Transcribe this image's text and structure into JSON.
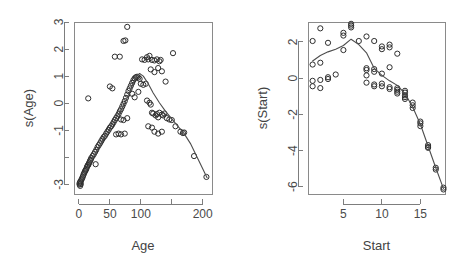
{
  "figure": {
    "background": "#ffffff",
    "foreground": "#3a3a3a",
    "point_color": "#2e2e2e",
    "curve_color": "#4d4d4d",
    "axis_color": "#7d7d7d"
  },
  "chart_data": [
    {
      "type": "scatter",
      "title": "",
      "xlabel": "Age",
      "ylabel": "s(Age)",
      "xlim": [
        -8,
        215
      ],
      "ylim": [
        -3.35,
        3.0
      ],
      "xticks": [
        0,
        50,
        100,
        150,
        200
      ],
      "xticklabels": [
        "0",
        "50",
        "100",
        "",
        "200"
      ],
      "yticks": [
        -3,
        -2,
        -1,
        0,
        1,
        2,
        3
      ],
      "yticklabels": [
        "-3",
        "",
        "-1",
        "0",
        "1",
        "2",
        "3"
      ],
      "grid": false,
      "legend": null,
      "series": [
        {
          "name": "partial residuals",
          "type": "scatter",
          "marker": "open-circle",
          "points": [
            [
              1,
              -2.95
            ],
            [
              1,
              -3.0
            ],
            [
              2,
              -2.9
            ],
            [
              2,
              -3.05
            ],
            [
              3,
              -2.88
            ],
            [
              3,
              -2.98
            ],
            [
              4,
              -2.82
            ],
            [
              5,
              -2.78
            ],
            [
              6,
              -2.72
            ],
            [
              7,
              -2.66
            ],
            [
              8,
              -2.6
            ],
            [
              9,
              -2.55
            ],
            [
              10,
              -2.5
            ],
            [
              11,
              -2.46
            ],
            [
              12,
              -2.42
            ],
            [
              13,
              -2.35
            ],
            [
              14,
              -2.3
            ],
            [
              15,
              -2.28
            ],
            [
              16,
              -2.22
            ],
            [
              17,
              -2.18
            ],
            [
              18,
              -2.12
            ],
            [
              19,
              -2.08
            ],
            [
              20,
              -2.02
            ],
            [
              22,
              -1.95
            ],
            [
              24,
              -1.88
            ],
            [
              26,
              -1.8
            ],
            [
              27,
              -2.25
            ],
            [
              28,
              -1.72
            ],
            [
              30,
              -1.62
            ],
            [
              32,
              -1.55
            ],
            [
              34,
              -1.48
            ],
            [
              36,
              -1.4
            ],
            [
              38,
              -1.32
            ],
            [
              40,
              -1.25
            ],
            [
              42,
              -1.2
            ],
            [
              44,
              -1.12
            ],
            [
              46,
              -1.05
            ],
            [
              48,
              -0.98
            ],
            [
              50,
              -0.9
            ],
            [
              52,
              -0.85
            ],
            [
              54,
              -0.78
            ],
            [
              56,
              -0.7
            ],
            [
              58,
              -0.62
            ],
            [
              60,
              -0.55
            ],
            [
              62,
              -0.48
            ],
            [
              64,
              -0.4
            ],
            [
              66,
              -0.3
            ],
            [
              68,
              -0.22
            ],
            [
              70,
              -0.12
            ],
            [
              72,
              -0.02
            ],
            [
              74,
              0.08
            ],
            [
              76,
              0.2
            ],
            [
              78,
              0.32
            ],
            [
              80,
              0.45
            ],
            [
              82,
              0.55
            ],
            [
              84,
              0.65
            ],
            [
              86,
              0.75
            ],
            [
              88,
              0.85
            ],
            [
              90,
              0.92
            ],
            [
              92,
              0.96
            ],
            [
              94,
              0.98
            ],
            [
              96,
              0.95
            ],
            [
              98,
              0.9
            ],
            [
              15,
              0.18
            ],
            [
              50,
              0.62
            ],
            [
              54,
              0.55
            ],
            [
              58,
              1.72
            ],
            [
              66,
              1.72
            ],
            [
              72,
              2.3
            ],
            [
              75,
              2.32
            ],
            [
              78,
              2.82
            ],
            [
              68,
              -0.6
            ],
            [
              72,
              -0.62
            ],
            [
              78,
              -0.55
            ],
            [
              60,
              -1.15
            ],
            [
              64,
              -1.12
            ],
            [
              68,
              -1.15
            ],
            [
              74,
              -1.12
            ],
            [
              86,
              0.35
            ],
            [
              90,
              0.22
            ],
            [
              96,
              0.42
            ],
            [
              102,
              1.62
            ],
            [
              106,
              1.6
            ],
            [
              110,
              1.7
            ],
            [
              112,
              1.62
            ],
            [
              114,
              1.75
            ],
            [
              118,
              1.6
            ],
            [
              122,
              1.58
            ],
            [
              126,
              1.62
            ],
            [
              130,
              1.55
            ],
            [
              132,
              1.6
            ],
            [
              116,
              1.25
            ],
            [
              122,
              1.15
            ],
            [
              128,
              1.3
            ],
            [
              134,
              1.18
            ],
            [
              140,
              0.8
            ],
            [
              152,
              1.85
            ],
            [
              100,
              0.72
            ],
            [
              104,
              0.68
            ],
            [
              108,
              0.72
            ],
            [
              110,
              0.1
            ],
            [
              114,
              0.02
            ],
            [
              116,
              -0.05
            ],
            [
              118,
              -0.35
            ],
            [
              120,
              -0.38
            ],
            [
              124,
              -0.45
            ],
            [
              126,
              -0.4
            ],
            [
              128,
              -0.52
            ],
            [
              130,
              -0.35
            ],
            [
              134,
              -0.42
            ],
            [
              136,
              -0.45
            ],
            [
              138,
              -0.38
            ],
            [
              112,
              -0.85
            ],
            [
              118,
              -0.9
            ],
            [
              122,
              -1.05
            ],
            [
              128,
              -1.12
            ],
            [
              134,
              -1.05
            ],
            [
              142,
              -0.55
            ],
            [
              146,
              -0.6
            ],
            [
              150,
              -0.62
            ],
            [
              156,
              -0.85
            ],
            [
              164,
              -1.05
            ],
            [
              168,
              -1.1
            ],
            [
              170,
              -1.08
            ],
            [
              186,
              -1.95
            ],
            [
              206,
              -2.72
            ]
          ]
        },
        {
          "name": "smooth fit",
          "type": "line",
          "points": [
            [
              0,
              -3.05
            ],
            [
              10,
              -2.55
            ],
            [
              20,
              -2.12
            ],
            [
              30,
              -1.7
            ],
            [
              40,
              -1.3
            ],
            [
              50,
              -0.92
            ],
            [
              60,
              -0.55
            ],
            [
              70,
              -0.18
            ],
            [
              80,
              0.3
            ],
            [
              88,
              0.75
            ],
            [
              94,
              1.02
            ],
            [
              98,
              1.1
            ],
            [
              104,
              1.0
            ],
            [
              112,
              0.72
            ],
            [
              120,
              0.38
            ],
            [
              130,
              0.02
            ],
            [
              140,
              -0.3
            ],
            [
              150,
              -0.58
            ],
            [
              160,
              -0.85
            ],
            [
              170,
              -1.12
            ],
            [
              180,
              -1.48
            ],
            [
              190,
              -1.95
            ],
            [
              200,
              -2.42
            ],
            [
              207,
              -2.75
            ]
          ]
        }
      ]
    },
    {
      "type": "scatter",
      "title": "",
      "xlabel": "Start",
      "ylabel": "s(Start)",
      "xlim": [
        0.4,
        18.2
      ],
      "ylim": [
        -6.4,
        3.1
      ],
      "xticks": [
        5,
        10,
        15
      ],
      "xticklabels": [
        "5",
        "10",
        "15"
      ],
      "yticks": [
        -6,
        -4,
        -2,
        0,
        2
      ],
      "yticklabels": [
        "-6",
        "-4",
        "-2",
        "0",
        "2"
      ],
      "grid": false,
      "legend": null,
      "series": [
        {
          "name": "partial residuals",
          "type": "scatter",
          "marker": "open-circle",
          "points": [
            [
              1,
              2.05
            ],
            [
              1,
              0.75
            ],
            [
              1,
              -0.15
            ],
            [
              1,
              -0.45
            ],
            [
              2,
              2.75
            ],
            [
              2,
              0.85
            ],
            [
              2,
              -0.1
            ],
            [
              2,
              -0.55
            ],
            [
              3,
              1.95
            ],
            [
              3,
              0.05
            ],
            [
              3,
              -0.05
            ],
            [
              4,
              0.2
            ],
            [
              5,
              2.35
            ],
            [
              5,
              2.5
            ],
            [
              5,
              1.55
            ],
            [
              6,
              2.9
            ],
            [
              6,
              3.0
            ],
            [
              6,
              2.8
            ],
            [
              7,
              2.05
            ],
            [
              8,
              2.3
            ],
            [
              8,
              0.55
            ],
            [
              8,
              0.45
            ],
            [
              8,
              0.15
            ],
            [
              8,
              -0.25
            ],
            [
              9,
              2.05
            ],
            [
              9,
              0.5
            ],
            [
              9,
              0.35
            ],
            [
              9,
              -0.35
            ],
            [
              9,
              -0.45
            ],
            [
              10,
              1.75
            ],
            [
              10,
              1.6
            ],
            [
              10,
              0.25
            ],
            [
              10,
              -0.3
            ],
            [
              10,
              -0.45
            ],
            [
              11,
              1.85
            ],
            [
              11,
              1.7
            ],
            [
              11,
              0.6
            ],
            [
              11,
              -0.5
            ],
            [
              11,
              -0.6
            ],
            [
              12,
              1.35
            ],
            [
              12,
              -0.55
            ],
            [
              12,
              -0.65
            ],
            [
              12,
              -0.75
            ],
            [
              12,
              -0.85
            ],
            [
              13,
              -0.7
            ],
            [
              13,
              -0.8
            ],
            [
              13,
              -0.95
            ],
            [
              13,
              -1.05
            ],
            [
              13,
              -1.15
            ],
            [
              14,
              -1.35
            ],
            [
              14,
              -1.5
            ],
            [
              14,
              -1.65
            ],
            [
              15,
              -2.4
            ],
            [
              15,
              -2.5
            ],
            [
              15,
              -2.65
            ],
            [
              16,
              -3.7
            ],
            [
              16,
              -3.8
            ],
            [
              16,
              -3.85
            ],
            [
              17,
              -4.95
            ],
            [
              17,
              -5.05
            ],
            [
              18,
              -6.05
            ],
            [
              18,
              -6.15
            ]
          ]
        },
        {
          "name": "smooth fit",
          "type": "line",
          "points": [
            [
              1,
              0.95
            ],
            [
              2,
              1.25
            ],
            [
              3,
              1.45
            ],
            [
              4,
              1.6
            ],
            [
              5,
              1.8
            ],
            [
              6,
              2.15
            ],
            [
              7,
              1.85
            ],
            [
              8,
              1.4
            ],
            [
              9,
              0.55
            ],
            [
              10,
              0.15
            ],
            [
              11,
              -0.15
            ],
            [
              12,
              -0.4
            ],
            [
              13,
              -0.85
            ],
            [
              14,
              -1.6
            ],
            [
              15,
              -2.55
            ],
            [
              16,
              -3.75
            ],
            [
              17,
              -4.95
            ],
            [
              18,
              -6.1
            ]
          ]
        }
      ]
    }
  ]
}
